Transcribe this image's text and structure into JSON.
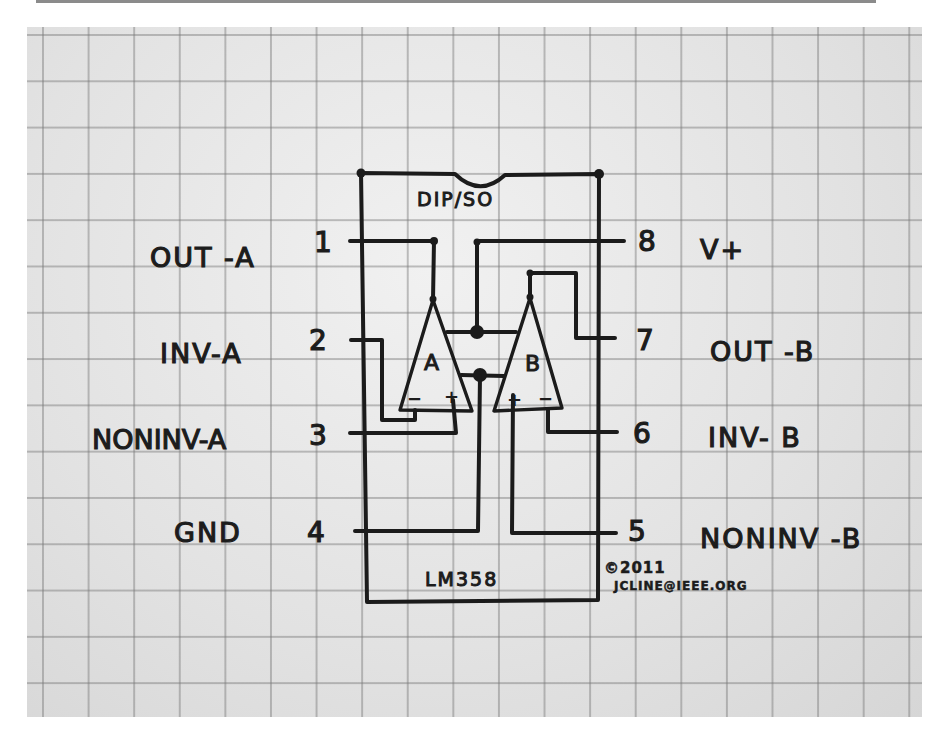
{
  "diagram": {
    "package_label": "DIP/SO",
    "part_number": "LM358",
    "copyright": "©2011",
    "author_email": "JCLINE@IEEE.ORG",
    "ink_color": "#1b1b1b",
    "paper_color": "#e4e4e4",
    "grid_color": "#8a8a8a",
    "pins_left": [
      {
        "number": "1",
        "name": "OUT -A"
      },
      {
        "number": "2",
        "name": "INV-A"
      },
      {
        "number": "3",
        "name": "NONINV-A"
      },
      {
        "number": "4",
        "name": "GND"
      }
    ],
    "pins_right": [
      {
        "number": "8",
        "name": "V+"
      },
      {
        "number": "7",
        "name": "OUT -B"
      },
      {
        "number": "6",
        "name": "INV- B"
      },
      {
        "number": "5",
        "name": "NONINV -B"
      }
    ],
    "opamps": [
      {
        "label": "A",
        "inv_sign": "−",
        "noninv_sign": "+"
      },
      {
        "label": "B",
        "inv_sign": "−",
        "noninv_sign": "+"
      }
    ]
  }
}
